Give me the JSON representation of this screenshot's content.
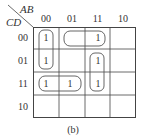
{
  "kmap": {
    "row_var": "CD",
    "col_var": "AB",
    "col_labels": [
      "00",
      "01",
      "11",
      "10"
    ],
    "row_labels": [
      "00",
      "01",
      "11",
      "10"
    ],
    "cells": [
      [
        "1",
        "",
        "1",
        ""
      ],
      [
        "1",
        "",
        "1",
        ""
      ],
      [
        "1",
        "1",
        "1",
        ""
      ],
      [
        "",
        "",
        "",
        ""
      ]
    ],
    "groups": [
      {
        "cells": [
          [
            0,
            0
          ],
          [
            1,
            0
          ]
        ],
        "desc": "column 00, rows 00-01"
      },
      {
        "cells": [
          [
            0,
            1
          ],
          [
            0,
            2
          ]
        ],
        "desc": "row 00, columns 01-11"
      },
      {
        "cells": [
          [
            1,
            2
          ],
          [
            2,
            2
          ]
        ],
        "desc": "column 11, rows 01-11"
      },
      {
        "cells": [
          [
            2,
            0
          ],
          [
            2,
            1
          ]
        ],
        "desc": "row 11, columns 00-01"
      }
    ],
    "one_label": "1",
    "caption": "(b)"
  }
}
